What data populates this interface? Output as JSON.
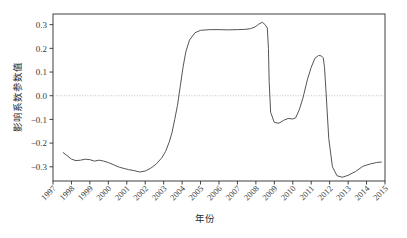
{
  "chart_data": {
    "type": "line",
    "title": "",
    "xlabel": "年份",
    "ylabel": "影响系数参数值",
    "xlim": [
      1997,
      2015
    ],
    "ylim": [
      -0.36,
      0.345
    ],
    "grid": false,
    "legend": null,
    "zero_reference_line": {
      "value": 0.0,
      "style": "dotted",
      "color": "#b9b9b9"
    },
    "x_tick_labels": [
      "1997",
      "1998",
      "1999",
      "2000",
      "2001",
      "2002",
      "2003",
      "2004",
      "2005",
      "2006",
      "2007",
      "2008",
      "2009",
      "2010",
      "2011",
      "2012",
      "2013",
      "2014",
      "2015"
    ],
    "x_tick_values": [
      1997,
      1998,
      1999,
      2000,
      2001,
      2002,
      2003,
      2004,
      2005,
      2006,
      2007,
      2008,
      2009,
      2010,
      2011,
      2012,
      2013,
      2014,
      2015
    ],
    "x_tick_rotation_deg": 45,
    "y_tick_labels": [
      "0.3",
      "0.2",
      "0.1",
      "0.0",
      "-0.1",
      "-0.2",
      "-0.3"
    ],
    "y_tick_values": [
      0.3,
      0.2,
      0.1,
      0.0,
      -0.1,
      -0.2,
      -0.3
    ],
    "series": [
      {
        "name": "影响系数",
        "color": "#555555",
        "line_width": 1.0,
        "x": [
          1997.55,
          1997.75,
          1998.0,
          1998.25,
          1998.5,
          1998.75,
          1999.0,
          1999.25,
          1999.5,
          1999.75,
          2000.0,
          2000.3,
          2000.6,
          2000.9,
          2001.1,
          2001.4,
          2001.7,
          2002.0,
          2002.3,
          2002.6,
          2002.9,
          2003.1,
          2003.3,
          2003.45,
          2003.6,
          2003.75,
          2003.9,
          2004.05,
          2004.2,
          2004.4,
          2004.7,
          2005.0,
          2005.5,
          2006.0,
          2006.5,
          2007.0,
          2007.4,
          2007.7,
          2007.95,
          2008.15,
          2008.35,
          2008.5,
          2008.62,
          2008.68,
          2008.72,
          2008.8,
          2009.0,
          2009.25,
          2009.5,
          2009.75,
          2010.0,
          2010.15,
          2010.35,
          2010.55,
          2010.8,
          2011.0,
          2011.2,
          2011.4,
          2011.55,
          2011.65,
          2011.72,
          2011.8,
          2011.95,
          2012.15,
          2012.4,
          2012.7,
          2013.0,
          2013.4,
          2013.8,
          2014.2,
          2014.55,
          2014.8
        ],
        "y": [
          -0.24,
          -0.252,
          -0.268,
          -0.274,
          -0.272,
          -0.268,
          -0.27,
          -0.276,
          -0.272,
          -0.276,
          -0.282,
          -0.292,
          -0.302,
          -0.308,
          -0.312,
          -0.316,
          -0.322,
          -0.318,
          -0.306,
          -0.288,
          -0.262,
          -0.236,
          -0.196,
          -0.156,
          -0.1,
          -0.04,
          0.04,
          0.12,
          0.185,
          0.235,
          0.266,
          0.276,
          0.279,
          0.279,
          0.278,
          0.279,
          0.28,
          0.283,
          0.29,
          0.302,
          0.31,
          0.3,
          0.286,
          0.2,
          0.06,
          -0.07,
          -0.113,
          -0.116,
          -0.104,
          -0.096,
          -0.098,
          -0.094,
          -0.06,
          -0.01,
          0.07,
          0.12,
          0.158,
          0.17,
          0.168,
          0.16,
          0.12,
          0.02,
          -0.18,
          -0.3,
          -0.338,
          -0.344,
          -0.336,
          -0.32,
          -0.298,
          -0.288,
          -0.282,
          -0.28
        ]
      }
    ],
    "annotations": []
  }
}
